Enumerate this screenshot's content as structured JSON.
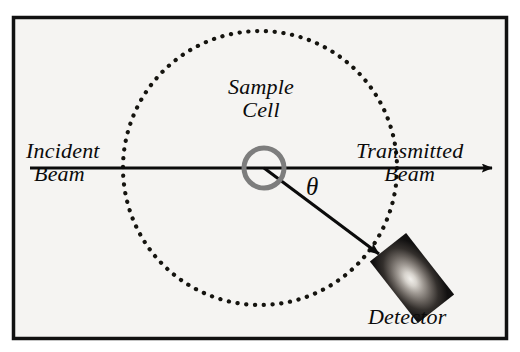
{
  "figure": {
    "background_color": "#f5f4f2",
    "frame_color": "#111111",
    "ink_color": "#0b0b0b",
    "cell_ring_color": "#7d7d7d"
  },
  "labels": {
    "incident_line1": "Incident",
    "incident_line2": "Beam",
    "transmitted_line1": "Transmitted",
    "transmitted_line2": "Beam",
    "sample_line1": "Sample",
    "sample_line2": "Cell",
    "angle_symbol": "θ",
    "detector": "Detector"
  },
  "geometry": {
    "frame": {
      "x": 12,
      "y": 16,
      "width": 496,
      "height": 324
    },
    "dotted_circle": {
      "cx": 260,
      "cy": 168,
      "r": 137,
      "dot_radius": 2.1
    },
    "sample_cell": {
      "cx": 264,
      "cy": 168,
      "r": 20,
      "stroke_width": 5
    },
    "incident_beam": {
      "x1": 30,
      "y1": 168,
      "x2": 500,
      "y2": 168
    },
    "scattered_beam": {
      "x1": 264,
      "y1": 168,
      "x2": 386,
      "y2": 259
    },
    "detector": {
      "cx": 412,
      "cy": 278,
      "width": 46,
      "height": 78,
      "rotation_deg": -38
    }
  }
}
